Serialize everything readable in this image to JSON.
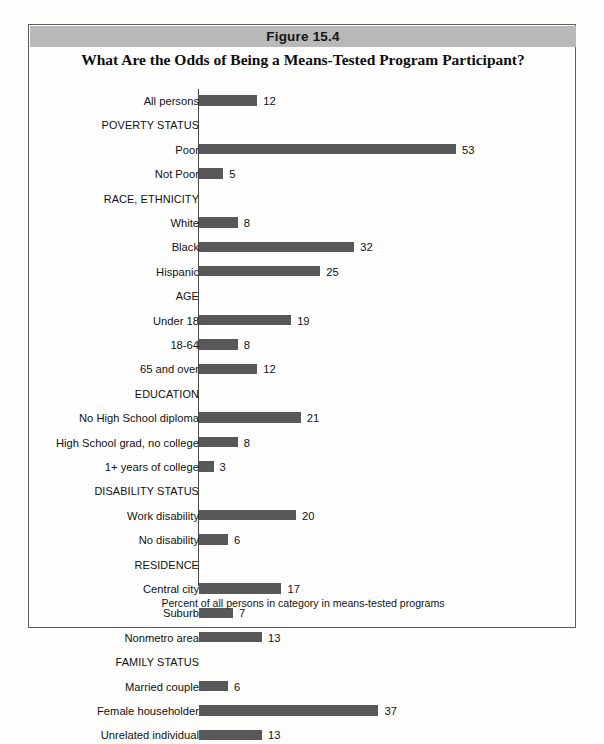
{
  "figure": {
    "band_label": "Figure 15.4",
    "subtitle": "What Are the Odds of Being a Means-Tested Program Participant?",
    "footnote": "Percent of all persons in category in means-tested programs",
    "band_color": "#b9b9b9",
    "bar_color": "#585858",
    "border_color": "#5e5e5e"
  },
  "chart_data": {
    "type": "bar",
    "orientation": "horizontal",
    "title": "What Are the Odds of Being a Means-Tested Program Participant?",
    "figure_number": "Figure 15.4",
    "xlabel": "Percent of all persons in category in means-tested programs",
    "ylabel": "",
    "xlim": [
      0,
      53
    ],
    "grid": false,
    "legend": false,
    "value_labels": true,
    "categories": [
      "All persons",
      "POVERTY STATUS",
      "Poor",
      "Not Poor",
      "RACE, ETHNICITY",
      "White",
      "Black",
      "Hispanic",
      "AGE",
      "Under 18",
      "18-64",
      "65 and over",
      "EDUCATION",
      "No High School diploma",
      "High School grad, no college",
      "1+ years of college",
      "DISABILITY STATUS",
      "Work disability",
      "No disability",
      "RESIDENCE",
      "Central city",
      "Suburb",
      "Nonmetro area",
      "FAMILY STATUS",
      "Married couple",
      "Female householder",
      "Unrelated individual"
    ],
    "is_group_header": [
      false,
      true,
      false,
      false,
      true,
      false,
      false,
      false,
      true,
      false,
      false,
      false,
      true,
      false,
      false,
      false,
      true,
      false,
      false,
      true,
      false,
      false,
      false,
      true,
      false,
      false,
      false
    ],
    "values": [
      12,
      null,
      53,
      5,
      null,
      8,
      32,
      25,
      null,
      19,
      8,
      12,
      null,
      21,
      8,
      3,
      null,
      20,
      6,
      null,
      17,
      7,
      13,
      null,
      6,
      37,
      13
    ]
  }
}
